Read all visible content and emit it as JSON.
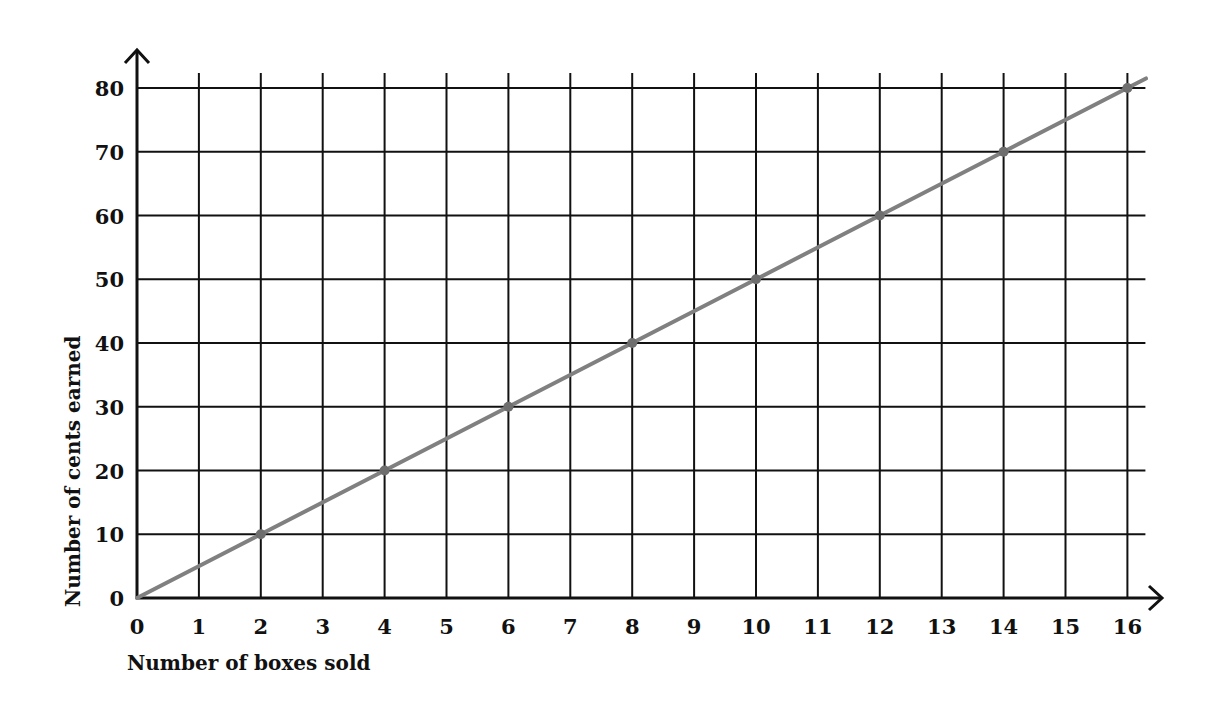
{
  "chart_data": {
    "type": "line",
    "title": "",
    "xlabel": "Number of boxes sold",
    "ylabel": "Number of cents earned",
    "x_ticks": [
      "0",
      "1",
      "2",
      "3",
      "4",
      "5",
      "6",
      "7",
      "8",
      "9",
      "10",
      "11",
      "12",
      "13",
      "14",
      "15",
      "16"
    ],
    "y_ticks": [
      "0",
      "10",
      "20",
      "30",
      "40",
      "50",
      "60",
      "70",
      "80"
    ],
    "xlim": [
      0,
      16
    ],
    "ylim": [
      0,
      80
    ],
    "grid": true,
    "legend": null,
    "series": [
      {
        "name": "Cents earned",
        "color": "#808080",
        "x": [
          0,
          2,
          4,
          6,
          8,
          10,
          12,
          14,
          16
        ],
        "y": [
          0,
          10,
          20,
          30,
          40,
          50,
          60,
          70,
          80
        ]
      }
    ]
  },
  "colors": {
    "grid": "#111111",
    "line": "#808080",
    "text": "#111111",
    "background": "#ffffff"
  }
}
